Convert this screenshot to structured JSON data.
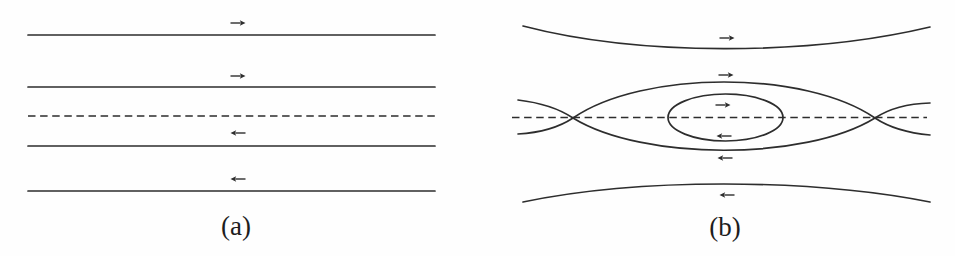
{
  "figure": {
    "background_color": "#fefefe",
    "line_color": "#2d2d2d",
    "panels": [
      {
        "id": "a",
        "label": "(a)",
        "x_start": 28,
        "x_end": 435,
        "field_lines": [
          {
            "style": "solid",
            "y": 35
          },
          {
            "style": "solid",
            "y": 87
          },
          {
            "style": "dashed",
            "y": 116
          },
          {
            "style": "solid",
            "y": 146
          },
          {
            "style": "solid",
            "y": 191
          }
        ],
        "arrows": [
          {
            "dir": "right",
            "x": 238,
            "y": 23
          },
          {
            "dir": "right",
            "x": 238,
            "y": 76
          },
          {
            "dir": "left",
            "x": 238,
            "y": 133
          },
          {
            "dir": "left",
            "x": 238,
            "y": 179
          }
        ]
      },
      {
        "id": "b",
        "label": "(b)",
        "x_points": [
          {
            "x": 573,
            "y": 118
          },
          {
            "x": 875,
            "y": 118
          }
        ],
        "o_point": {
          "x": 725.5,
          "y": 117.5
        },
        "arrows": [
          {
            "dir": "right",
            "x": 727,
            "y": 38
          },
          {
            "dir": "right",
            "x": 726,
            "y": 75
          },
          {
            "dir": "right",
            "x": 723,
            "y": 105
          },
          {
            "dir": "left",
            "x": 724,
            "y": 136
          },
          {
            "dir": "left",
            "x": 725,
            "y": 158
          },
          {
            "dir": "left",
            "x": 727,
            "y": 195
          }
        ]
      }
    ]
  }
}
